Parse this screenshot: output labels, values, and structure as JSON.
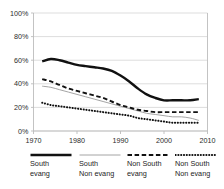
{
  "chart_data": {
    "type": "line",
    "title": "",
    "xlabel": "",
    "ylabel": "",
    "xlim": [
      1970,
      2010
    ],
    "ylim": [
      0,
      100
    ],
    "grid": true,
    "gridlines": "horizontal",
    "legend_position": "bottom",
    "x_ticks": [
      "1970",
      "1980",
      "1990",
      "2000",
      "2010"
    ],
    "x_tick_values": [
      1970,
      1980,
      1990,
      2000,
      2010
    ],
    "y_ticks": [
      "0%",
      "20%",
      "40%",
      "60%",
      "80%",
      "100%"
    ],
    "y_tick_values": [
      0,
      20,
      40,
      60,
      80,
      100
    ],
    "x": [
      1972,
      1974,
      1976,
      1978,
      1980,
      1982,
      1984,
      1986,
      1988,
      1990,
      1992,
      1994,
      1996,
      1998,
      2000,
      2002,
      2004,
      2006,
      2008
    ],
    "series": [
      {
        "name": "South evang",
        "style": "thick-solid",
        "color": "#111111",
        "values": [
          59,
          61,
          60,
          58,
          56,
          55,
          54,
          53,
          51,
          47,
          42,
          36,
          31,
          28,
          26,
          26,
          26,
          26,
          27
        ]
      },
      {
        "name": "South Non evang",
        "style": "thin-solid",
        "color": "#9a9a9a",
        "values": [
          38,
          37,
          35,
          33,
          31,
          29,
          27,
          25,
          23,
          21,
          19,
          17,
          15,
          14,
          13,
          12,
          12,
          11,
          9
        ]
      },
      {
        "name": "Non South evang",
        "style": "dashed",
        "color": "#111111",
        "values": [
          44,
          42,
          39,
          36,
          34,
          32,
          30,
          28,
          25,
          22,
          20,
          18,
          17,
          16,
          16,
          16,
          16,
          16,
          16
        ]
      },
      {
        "name": "Non South Non evang",
        "style": "dotted",
        "color": "#111111",
        "values": [
          24,
          22,
          21,
          20,
          19,
          18,
          17,
          16,
          15,
          14,
          13,
          11,
          10,
          9,
          8,
          7,
          7,
          7,
          7
        ]
      }
    ]
  },
  "legend": {
    "items": [
      {
        "label_line1": "South",
        "label_line2": "evang",
        "style": "thick-solid"
      },
      {
        "label_line1": "South",
        "label_line2": "Non evang",
        "style": "thin-solid"
      },
      {
        "label_line1": "Non South",
        "label_line2": "evang",
        "style": "dashed"
      },
      {
        "label_line1": "Non South",
        "label_line2": "Non evang",
        "style": "dotted"
      }
    ]
  },
  "colors": {
    "axis": "#bcbcbc",
    "grid": "#cfcfcf",
    "text": "#1d1d1d",
    "ink": "#111111",
    "gray_series": "#9a9a9a"
  }
}
